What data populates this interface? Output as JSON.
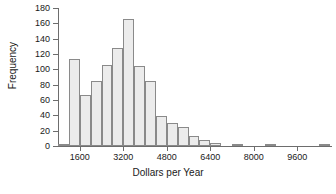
{
  "chart_data": {
    "type": "bar",
    "title": "",
    "xlabel": "Dollars per Year",
    "ylabel": "Frequency",
    "ylim": [
      0,
      180
    ],
    "xlim": [
      800,
      10800
    ],
    "grid": false,
    "legend": false,
    "bin_width": 400,
    "y_ticks": [
      0,
      20,
      40,
      60,
      80,
      100,
      120,
      140,
      160,
      180
    ],
    "x_ticks": [
      1600,
      3200,
      4800,
      6400,
      8000,
      9600
    ],
    "x_tick_labels": [
      "1600",
      "3200",
      "4800",
      "6400",
      "8000",
      "9600"
    ],
    "y_tick_labels": [
      "0",
      "20",
      "40",
      "60",
      "80",
      "100",
      "120",
      "140",
      "160",
      "180"
    ],
    "bin_starts": [
      800,
      1200,
      1600,
      2000,
      2400,
      2800,
      3200,
      3600,
      4000,
      4400,
      4800,
      5200,
      5600,
      6000,
      6400,
      6800,
      7200,
      7600,
      8000,
      8400,
      8800,
      9200,
      9600,
      10000,
      10400
    ],
    "categories": [
      "800",
      "1200",
      "1600",
      "2000",
      "2400",
      "2800",
      "3200",
      "3600",
      "4000",
      "4400",
      "4800",
      "5200",
      "5600",
      "6000",
      "6400",
      "6800",
      "7200",
      "7600",
      "8000",
      "8400",
      "8800",
      "9200",
      "9600",
      "10000",
      "10400"
    ],
    "values": [
      1,
      114,
      66,
      85,
      106,
      128,
      166,
      105,
      85,
      39,
      30,
      25,
      13,
      8,
      4,
      0,
      1,
      0,
      0,
      1,
      0,
      0,
      0,
      0,
      1
    ],
    "bar_fill_color": "#ececec",
    "bar_edge_color": "#8a8a8a",
    "axis_color": "#6d6d6d",
    "background_color": "#ffffff"
  }
}
